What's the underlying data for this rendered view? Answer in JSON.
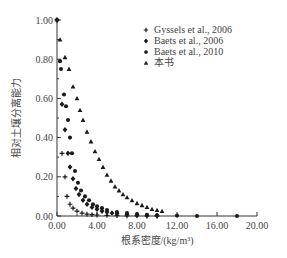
{
  "chart_data": {
    "type": "scatter",
    "title": "",
    "xlabel": "根系密度/(kg/m³)",
    "ylabel": "相对土壤分离能力",
    "xlim": [
      0,
      20
    ],
    "ylim": [
      0,
      1
    ],
    "xticks": [
      "0.00",
      "4.00",
      "8.00",
      "12.00",
      "16.00",
      "20.00"
    ],
    "yticks": [
      "0.00",
      "0.20",
      "0.40",
      "0.60",
      "0.80",
      "1.00"
    ],
    "grid": false,
    "legend_position": "upper-right",
    "series": [
      {
        "name": "Gyssels et al., 2006",
        "marker": "plus",
        "points": [
          [
            0.0,
            1.0
          ],
          [
            0.5,
            0.32
          ],
          [
            0.8,
            0.2
          ],
          [
            1.0,
            0.1
          ],
          [
            1.3,
            0.06
          ],
          [
            1.6,
            0.04
          ],
          [
            2.0,
            0.025
          ],
          [
            2.5,
            0.015
          ],
          [
            3.0,
            0.01
          ],
          [
            3.5,
            0.007
          ],
          [
            4.0,
            0.005
          ],
          [
            5.0,
            0.003
          ],
          [
            6.0,
            0.002
          ],
          [
            7.0,
            0.001
          ],
          [
            8.0,
            0.001
          ],
          [
            9.0,
            0.0
          ],
          [
            10.0,
            0.0
          ]
        ]
      },
      {
        "name": "Baets et al., 2006",
        "marker": "diamond",
        "points": [
          [
            0.0,
            1.0
          ],
          [
            0.5,
            0.57
          ],
          [
            0.8,
            0.44
          ],
          [
            1.1,
            0.32
          ],
          [
            1.3,
            0.25
          ],
          [
            1.6,
            0.19
          ],
          [
            1.9,
            0.14
          ],
          [
            2.2,
            0.11
          ],
          [
            2.6,
            0.08
          ],
          [
            3.0,
            0.06
          ],
          [
            3.5,
            0.045
          ],
          [
            4.0,
            0.035
          ],
          [
            4.5,
            0.025
          ],
          [
            5.0,
            0.02
          ],
          [
            5.5,
            0.015
          ],
          [
            6.0,
            0.012
          ],
          [
            7.0,
            0.008
          ],
          [
            8.0,
            0.005
          ],
          [
            9.0,
            0.003
          ],
          [
            10.0,
            0.002
          ]
        ]
      },
      {
        "name": "Baets et al., 2010",
        "marker": "circle",
        "points": [
          [
            0.0,
            1.0
          ],
          [
            0.3,
            0.79
          ],
          [
            0.4,
            0.75
          ],
          [
            0.7,
            0.62
          ],
          [
            0.9,
            0.56
          ],
          [
            1.1,
            0.49
          ],
          [
            1.3,
            0.4
          ],
          [
            1.5,
            0.32
          ],
          [
            1.8,
            0.23
          ],
          [
            2.1,
            0.17
          ],
          [
            2.4,
            0.13
          ],
          [
            2.8,
            0.1
          ],
          [
            3.2,
            0.08
          ],
          [
            3.6,
            0.06
          ],
          [
            4.0,
            0.05
          ],
          [
            4.5,
            0.04
          ],
          [
            5.0,
            0.03
          ],
          [
            6.0,
            0.02
          ],
          [
            7.0,
            0.015
          ],
          [
            8.0,
            0.01
          ],
          [
            9.0,
            0.006
          ],
          [
            10.0,
            0.004
          ],
          [
            12.0,
            0.002
          ],
          [
            14.0,
            0.0
          ],
          [
            18.0,
            0.0
          ]
        ]
      },
      {
        "name": "本书",
        "marker": "triangle",
        "points": [
          [
            0.3,
            0.9
          ],
          [
            0.8,
            0.81
          ],
          [
            1.2,
            0.75
          ],
          [
            1.6,
            0.66
          ],
          [
            2.0,
            0.6
          ],
          [
            2.3,
            0.54
          ],
          [
            2.6,
            0.49
          ],
          [
            3.0,
            0.43
          ],
          [
            3.4,
            0.38
          ],
          [
            3.8,
            0.33
          ],
          [
            4.2,
            0.29
          ],
          [
            4.6,
            0.25
          ],
          [
            5.0,
            0.21
          ],
          [
            5.4,
            0.18
          ],
          [
            5.8,
            0.15
          ],
          [
            6.2,
            0.13
          ],
          [
            6.6,
            0.11
          ],
          [
            7.0,
            0.095
          ],
          [
            7.5,
            0.08
          ],
          [
            8.0,
            0.065
          ],
          [
            8.5,
            0.055
          ],
          [
            9.0,
            0.045
          ],
          [
            9.5,
            0.035
          ],
          [
            10.0,
            0.03
          ],
          [
            10.5,
            0.025
          ]
        ]
      }
    ]
  },
  "legend": {
    "items": [
      {
        "label": "Gyssels et al., 2006",
        "marker": "plus"
      },
      {
        "label": "Baets et al., 2006",
        "marker": "diamond"
      },
      {
        "label": "Baets et al., 2010",
        "marker": "circle"
      },
      {
        "label": "本书",
        "marker": "triangle"
      }
    ]
  },
  "colors": {
    "marker": "#1a1a1a",
    "axis": "#333333",
    "text": "#444444"
  }
}
